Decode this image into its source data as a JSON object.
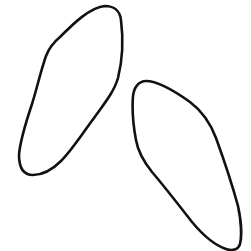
{
  "canvas": {
    "width": 251,
    "height": 251,
    "background": "#ffffff"
  },
  "shapes": [
    {
      "name": "left-sole-outline",
      "stroke": "#111111",
      "path": "M 105 6 C 113 6 120 10 121 20 C 123 36 123 58 118 78 C 114 92 104 104 94 118 C 82 134 72 150 61 161 C 52 170 42 175 33 175 C 23 175 19 167 19 155 C 20 140 26 122 32 104 C 37 88 41 70 46 56 C 49 48 54 42 60 37 C 72 25 90 7 105 6 Z"
    },
    {
      "name": "right-sole-outline",
      "stroke": "#111111",
      "path": "M 146 81 C 158 81 176 92 190 102 C 202 111 210 122 216 138 C 224 160 232 184 238 206 C 241 220 242 236 240 244 C 238 250 232 251 226 249 C 214 245 202 234 192 222 C 178 204 164 186 152 172 C 144 162 138 152 136 140 C 133 124 132 108 133 96 C 134 87 139 81 146 81 Z"
    }
  ]
}
